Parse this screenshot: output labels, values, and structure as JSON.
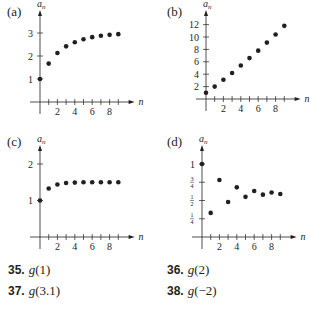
{
  "panels": [
    {
      "label": "(a)",
      "ylabel": "a",
      "ysub": "n",
      "xlabel": "n"
    },
    {
      "label": "(b)",
      "ylabel": "a",
      "ysub": "n",
      "xlabel": "n"
    },
    {
      "label": "(c)",
      "ylabel": "a",
      "ysub": "n",
      "xlabel": "n"
    },
    {
      "label": "(d)",
      "ylabel": "a",
      "ysub": "n",
      "xlabel": "n"
    }
  ],
  "exercises": [
    {
      "num": "35.",
      "fn": "g",
      "arg": "(1)"
    },
    {
      "num": "36.",
      "fn": "g",
      "arg": "(2)"
    },
    {
      "num": "37.",
      "fn": "g",
      "arg": "(3.1)"
    },
    {
      "num": "38.",
      "fn": "g",
      "arg": "(−2)"
    }
  ],
  "chart_data": [
    {
      "type": "scatter",
      "title": "(a)",
      "xlabel": "n",
      "ylabel": "a_n",
      "xticks": [
        2,
        4,
        6,
        8
      ],
      "yticks": [
        1,
        2,
        3
      ],
      "ylim": [
        0,
        3.5
      ],
      "xlim": [
        0,
        10
      ],
      "x": [
        0,
        1,
        2,
        3,
        4,
        5,
        6,
        7,
        8,
        9
      ],
      "values": [
        1,
        1.67,
        2.13,
        2.42,
        2.6,
        2.73,
        2.82,
        2.88,
        2.92,
        2.95
      ]
    },
    {
      "type": "scatter",
      "title": "(b)",
      "xlabel": "n",
      "ylabel": "a_n",
      "xticks": [
        2,
        4,
        6,
        8
      ],
      "yticks": [
        2,
        4,
        6,
        8,
        10,
        12
      ],
      "ylim": [
        0,
        13
      ],
      "xlim": [
        0,
        10
      ],
      "x": [
        0,
        1,
        2,
        3,
        4,
        5,
        6,
        7,
        8,
        9
      ],
      "values": [
        1,
        2,
        3.1,
        4.2,
        5.4,
        6.6,
        7.8,
        9.1,
        10.4,
        11.8
      ]
    },
    {
      "type": "scatter",
      "title": "(c)",
      "xlabel": "n",
      "ylabel": "a_n",
      "xticks": [
        2,
        4,
        6,
        8
      ],
      "yticks": [
        1,
        2
      ],
      "ylim": [
        0,
        2.3
      ],
      "xlim": [
        0,
        10
      ],
      "x": [
        0,
        1,
        2,
        3,
        4,
        5,
        6,
        7,
        8,
        9
      ],
      "values": [
        1,
        1.33,
        1.44,
        1.48,
        1.49,
        1.5,
        1.5,
        1.5,
        1.5,
        1.5
      ]
    },
    {
      "type": "scatter",
      "title": "(d)",
      "xlabel": "n",
      "ylabel": "a_n",
      "xticks": [
        2,
        4,
        6,
        8
      ],
      "yticks": [
        "1/4",
        "1/2",
        "3/4",
        "1"
      ],
      "ylim": [
        0,
        1.1
      ],
      "xlim": [
        0,
        10
      ],
      "x": [
        0,
        1,
        2,
        3,
        4,
        5,
        6,
        7,
        8,
        9
      ],
      "values": [
        1,
        0.33,
        0.78,
        0.48,
        0.68,
        0.55,
        0.63,
        0.58,
        0.61,
        0.59
      ]
    }
  ]
}
